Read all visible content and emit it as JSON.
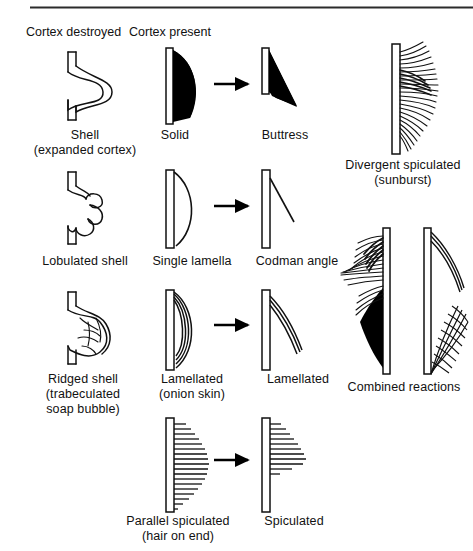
{
  "page": {
    "top_rule": {
      "visible": true,
      "x": 30,
      "y": 7,
      "width": 443,
      "height": 2
    }
  },
  "headers": [
    {
      "name": "header-cortex-destroyed",
      "text": "Cortex destroyed",
      "x": 26,
      "y": 26
    },
    {
      "name": "header-cortex-present",
      "text": "Cortex present",
      "x": 129,
      "y": 26
    }
  ],
  "columns": {
    "cortex_destroyed": "Cortex destroyed",
    "cortex_present": "Cortex present"
  },
  "figures": [
    {
      "id": "shell",
      "name": "shell-figure",
      "label": "Shell\n(expanded cortex)",
      "column": "cortex_destroyed",
      "row": 1
    },
    {
      "id": "solid",
      "name": "solid-figure",
      "label": "Solid",
      "column": "cortex_present",
      "row": 1
    },
    {
      "id": "buttress",
      "name": "buttress-figure",
      "label": "Buttress",
      "column": "interrupted",
      "row": 1
    },
    {
      "id": "lobulated-shell",
      "name": "lobulated-shell-figure",
      "label": "Lobulated shell",
      "column": "cortex_destroyed",
      "row": 2
    },
    {
      "id": "single-lamella",
      "name": "single-lamella-figure",
      "label": "Single lamella",
      "column": "cortex_present",
      "row": 2
    },
    {
      "id": "codman-angle",
      "name": "codman-angle-figure",
      "label": "Codman angle",
      "column": "interrupted",
      "row": 2
    },
    {
      "id": "ridged-shell",
      "name": "ridged-shell-figure",
      "label": "Ridged shell\n(trabeculated\nsoap bubble)",
      "column": "cortex_destroyed",
      "row": 3
    },
    {
      "id": "lamellated",
      "name": "lamellated-figure",
      "label": "Lamellated\n(onion skin)",
      "column": "cortex_present",
      "row": 3
    },
    {
      "id": "lamellated-interrupted",
      "name": "lamellated-interrupted-figure",
      "label": "Lamellated",
      "column": "interrupted",
      "row": 3
    },
    {
      "id": "parallel-spiculated",
      "name": "parallel-spiculated-figure",
      "label": "Parallel spiculated\n(hair on end)",
      "column": "cortex_present",
      "row": 4
    },
    {
      "id": "spiculated",
      "name": "spiculated-figure",
      "label": "Spiculated",
      "column": "interrupted",
      "row": 4
    },
    {
      "id": "divergent-spiculated",
      "name": "divergent-spiculated-figure",
      "label": "Divergent spiculated\n(sunburst)",
      "column": "right",
      "row": 1
    },
    {
      "id": "combined-reactions",
      "name": "combined-reactions-figure",
      "label": "Combined reactions",
      "column": "right",
      "row": 2
    }
  ],
  "labels": {
    "shell": "Shell",
    "shell_sub": "(expanded cortex)",
    "solid": "Solid",
    "buttress": "Buttress",
    "lobulated_shell": "Lobulated shell",
    "single_lamella": "Single lamella",
    "codman_angle": "Codman angle",
    "ridged_shell": "Ridged shell",
    "ridged_shell_sub1": "(trabeculated",
    "ridged_shell_sub2": "soap bubble)",
    "lamellated": "Lamellated",
    "lamellated_sub": "(onion skin)",
    "lamellated_interrupted": "Lamellated",
    "parallel_spiculated": "Parallel spiculated",
    "parallel_spiculated_sub": "(hair on end)",
    "spiculated": "Spiculated",
    "divergent_spiculated": "Divergent spiculated",
    "divergent_spiculated_sub": "(sunburst)",
    "combined_reactions": "Combined reactions"
  },
  "colors": {
    "ink": "#111111",
    "fill_black": "#000000",
    "paper": "#ffffff",
    "rule": "#2b2b2b"
  },
  "arrows": [
    {
      "name": "arrow-solid-to-buttress",
      "row": 1,
      "x1": 215,
      "x2": 250,
      "y": 84
    },
    {
      "name": "arrow-lamella-to-codman",
      "row": 2,
      "x1": 215,
      "x2": 250,
      "y": 206
    },
    {
      "name": "arrow-lamellated-to-interrupted",
      "row": 3,
      "x1": 215,
      "x2": 250,
      "y": 325
    },
    {
      "name": "arrow-spiculated-to-interrupted",
      "row": 4,
      "x1": 215,
      "x2": 250,
      "y": 460
    }
  ]
}
